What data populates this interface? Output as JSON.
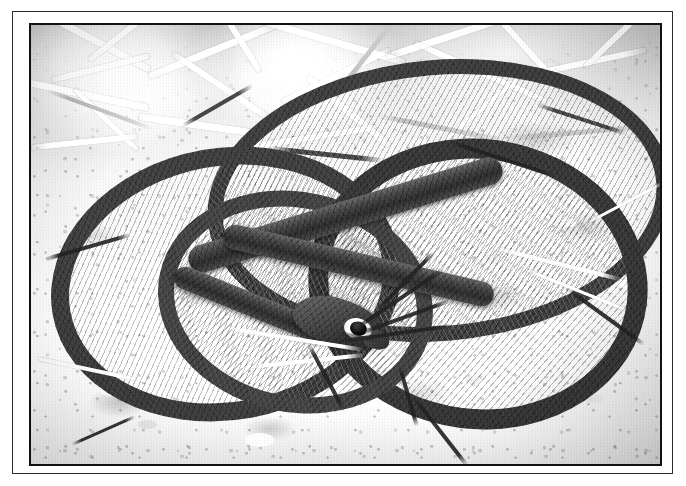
{
  "frame": {
    "outer_background": "#ffffff",
    "rule_color": "#2b2b2b",
    "mat_color": "#ffffff",
    "photo_edge_color": "#111111"
  },
  "photo": {
    "caption": "",
    "medium": "black-and-white photograph",
    "subject": "snake",
    "description": "A dark, smooth-scaled snake coiled in a loose figure-eight on bare pale sandy ground, head resting near the centre facing right; dry grass and straw fill the upper portion of the frame.",
    "palette": {
      "ground_light": "#fbfbfa",
      "ground_mid": "#e9e6e0",
      "ground_dark": "#d2cec6",
      "snake_dark": "#2e2c28",
      "snake_mid": "#46443e",
      "snake_highlight": "#6f6c64",
      "straw_white": "#ffffff",
      "twig_dark": "#2a2925",
      "eye_black": "#000000",
      "eye_ring": "#f2f0eb"
    },
    "elements": {
      "snake_label": "coiled snake",
      "head_label": "snake head",
      "eye_label": "snake eye",
      "ground_label": "sandy ground",
      "straw_label": "dry grass and straw",
      "twig_label": "scattered twigs"
    }
  }
}
